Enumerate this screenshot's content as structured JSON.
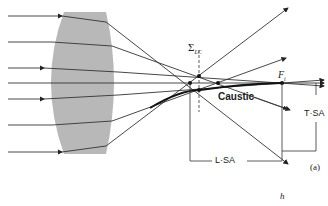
{
  "diagram": {
    "labels": {
      "sigma": "Σ",
      "sigma_sub": "LC",
      "caustic": "Caustic",
      "focal": "F",
      "focal_sub": "i",
      "tsa": "T·SA",
      "lsa": "L·SA",
      "panel": "(a)",
      "h": "h"
    },
    "colors": {
      "lens": "#b8b8b8",
      "ray": "#333333",
      "background": "#ffffff"
    }
  }
}
